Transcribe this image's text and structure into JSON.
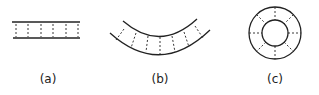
{
  "diagram": {
    "panels": [
      {
        "id": "a",
        "label": "(a)",
        "shape": "straight strip with dashed cross-lines"
      },
      {
        "id": "b",
        "label": "(b)",
        "shape": "curved (arc) strip with dashed radial lines"
      },
      {
        "id": "c",
        "label": "(c)",
        "shape": "annulus (ring) with dashed radial lines"
      }
    ],
    "colors": {
      "stroke": "#222222",
      "background": "#ffffff"
    }
  }
}
